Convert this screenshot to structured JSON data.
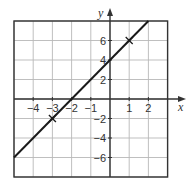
{
  "chart_data": {
    "type": "line",
    "title": "",
    "xlabel": "x",
    "ylabel": "y",
    "xlim": [
      -5,
      3
    ],
    "ylim": [
      -8,
      8
    ],
    "grid": true,
    "x_grid_step": 1,
    "y_grid_step": 2,
    "x_ticks": [
      {
        "value": -4,
        "label": "−4"
      },
      {
        "value": -3,
        "label": "−3"
      },
      {
        "value": -2,
        "label": "−2"
      },
      {
        "value": -1,
        "label": "−1"
      },
      {
        "value": 1,
        "label": "1"
      },
      {
        "value": 2,
        "label": "2"
      }
    ],
    "y_ticks": [
      {
        "value": 6,
        "label": "6"
      },
      {
        "value": 4,
        "label": "4"
      },
      {
        "value": 2,
        "label": "2"
      },
      {
        "value": -2,
        "label": "−2"
      },
      {
        "value": -4,
        "label": "−4"
      },
      {
        "value": -6,
        "label": "−6"
      }
    ],
    "series": [
      {
        "name": "y = 2x + 4",
        "x": [
          -5,
          2
        ],
        "y": [
          -6,
          8
        ],
        "color": "#1a1a1a"
      }
    ],
    "marked_points": [
      {
        "x": -3,
        "y": -2,
        "marker": "cross"
      },
      {
        "x": 1,
        "y": 6,
        "marker": "cross"
      }
    ],
    "colors": {
      "line": "#1a1a1a",
      "grid": "#b8b8b8",
      "axis": "#333333",
      "frame": "#333333"
    }
  }
}
